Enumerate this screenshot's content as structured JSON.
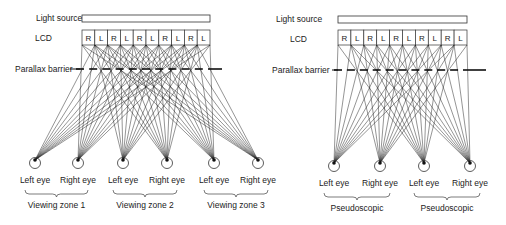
{
  "left_panel": {
    "light_source_label": "Light source",
    "lcd_label": "LCD",
    "barrier_label": "Parallax barrier",
    "lcd_cells": [
      "R",
      "L",
      "R",
      "L",
      "R",
      "L",
      "R",
      "L",
      "R",
      "L"
    ],
    "eyes": [
      {
        "label": "Left eye"
      },
      {
        "label": "Right eye"
      },
      {
        "label": "Left eye"
      },
      {
        "label": "Right eye"
      },
      {
        "label": "Left eye"
      },
      {
        "label": "Right eye"
      }
    ],
    "zones": [
      "Viewing zone 1",
      "Viewing zone 2",
      "Viewing zone 3"
    ]
  },
  "right_panel": {
    "light_source_label": "Light source",
    "lcd_label": "LCD",
    "barrier_label": "Parallax barrier",
    "lcd_cells": [
      "R",
      "L",
      "R",
      "L",
      "R",
      "L",
      "R",
      "L",
      "R",
      "L"
    ],
    "eyes": [
      {
        "label": "Left eye"
      },
      {
        "label": "Right eye"
      },
      {
        "label": "Left eye"
      },
      {
        "label": "Right eye"
      }
    ],
    "zones": [
      "Pseudoscopic",
      "Pseudoscopic"
    ]
  },
  "colors": {
    "line": "#111111",
    "text": "#222222",
    "background": "#ffffff"
  }
}
